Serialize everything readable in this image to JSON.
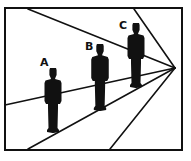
{
  "diagram": {
    "type": "perspective-illusion",
    "colors": {
      "background": "#ffffff",
      "ink": "#111111"
    },
    "frame": {
      "x1": 5,
      "y1": 8,
      "x2": 182,
      "y2": 150
    },
    "vanishing_point": {
      "x": 175,
      "y": 68
    },
    "perspective_lines": [
      {
        "name": "top-left-line",
        "x": 28,
        "y": 9
      },
      {
        "name": "top-right-line",
        "x": 134,
        "y": 9
      },
      {
        "name": "left-wall-line",
        "x": 5,
        "y": 105
      },
      {
        "name": "floor-left-line",
        "x": 28,
        "y": 149
      },
      {
        "name": "floor-right-line",
        "x": 110,
        "y": 149
      }
    ],
    "figures": [
      {
        "label": "A",
        "cx": 53,
        "top": 68,
        "bottom": 133,
        "label_x": 40,
        "label_y": 66
      },
      {
        "label": "B",
        "cx": 100,
        "top": 44,
        "bottom": 111,
        "label_x": 85,
        "label_y": 50
      },
      {
        "label": "C",
        "cx": 136,
        "top": 23,
        "bottom": 88,
        "label_x": 119,
        "label_y": 29
      }
    ]
  }
}
